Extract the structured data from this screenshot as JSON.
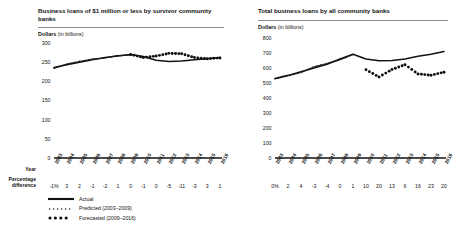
{
  "legend": {
    "items": [
      {
        "label": "Actual",
        "style": "solid-line",
        "color": "#111111"
      },
      {
        "label": "Predicted (2003–2009)",
        "style": "fine-dots",
        "color": "#1b1b1b"
      },
      {
        "label": "Forecasted (2009–2016)",
        "style": "bold-dots",
        "color": "#0d0d0d"
      }
    ]
  },
  "row_labels": {
    "year": "Year",
    "percentage_difference": "Percentage difference"
  },
  "axis_caption": {
    "strong": "Dollars",
    "light": "(in billions)"
  },
  "chart_data": [
    {
      "type": "line",
      "panel": "left",
      "title": "Business loans of $1 million or less by survivor community banks",
      "xlabel": "Year",
      "ylabel": "Dollars (in billions)",
      "ylim": [
        0,
        300
      ],
      "yticks": [
        300,
        250,
        200,
        150,
        100,
        50,
        0
      ],
      "ytick_labels": [
        "300",
        "250",
        "200",
        "150",
        "100",
        "50",
        "0"
      ],
      "grid": false,
      "legend_position": "below-left",
      "categories": [
        "2003",
        "2004",
        "2005",
        "2006",
        "2007",
        "2008",
        "2009",
        "2010",
        "2011",
        "2012",
        "2013",
        "2014",
        "2015",
        "2016"
      ],
      "series": [
        {
          "name": "Actual",
          "style": "solid-line",
          "values": [
            236,
            243,
            250,
            256,
            262,
            266,
            270,
            265,
            255,
            252,
            253,
            256,
            259,
            262
          ]
        },
        {
          "name": "Predicted (2003–2009)",
          "style": "fine-dots",
          "values": [
            234,
            245,
            252,
            258,
            261,
            267,
            269,
            null,
            null,
            null,
            null,
            null,
            null,
            null
          ]
        },
        {
          "name": "Forecasted (2009–2016)",
          "style": "bold-dots",
          "values": [
            null,
            null,
            null,
            null,
            null,
            null,
            270,
            262,
            266,
            273,
            272,
            262,
            259,
            261
          ]
        }
      ],
      "percentage_difference": [
        "-1%",
        "3",
        "2",
        "-1",
        "-2",
        "1",
        "0",
        "-1",
        "0",
        "-5",
        "-11",
        "-3",
        "3",
        "1"
      ]
    },
    {
      "type": "line",
      "panel": "right",
      "title": "Total business loans by all community banks",
      "xlabel": "Year",
      "ylabel": "Dollars (in billions)",
      "ylim": [
        0,
        800
      ],
      "yticks": [
        800,
        700,
        600,
        500,
        400,
        300,
        200,
        100,
        0
      ],
      "ytick_labels": [
        "800",
        "700",
        "600",
        "500",
        "400",
        "300",
        "200",
        "100",
        "0"
      ],
      "grid": false,
      "legend_position": "none",
      "categories": [
        "2003",
        "2004",
        "2005",
        "2006",
        "2007",
        "2008",
        "2009",
        "2010",
        "2011",
        "2012",
        "2013",
        "2014",
        "2015",
        "2016"
      ],
      "series": [
        {
          "name": "Actual",
          "style": "solid-line",
          "values": [
            530,
            551,
            575,
            600,
            625,
            660,
            692,
            660,
            648,
            650,
            660,
            678,
            692,
            710
          ]
        },
        {
          "name": "Predicted (2003–2009)",
          "style": "fine-dots",
          "values": [
            528,
            548,
            570,
            608,
            630,
            655,
            690,
            null,
            null,
            null,
            null,
            null,
            null,
            null
          ]
        },
        {
          "name": "Forecasted (2009–2016)",
          "style": "bold-dots",
          "values": [
            null,
            null,
            null,
            null,
            null,
            null,
            null,
            588,
            540,
            590,
            622,
            560,
            552,
            572
          ]
        }
      ],
      "percentage_difference": [
        "0%",
        "2",
        "4",
        "-3",
        "-4",
        "0",
        "1",
        "10",
        "20",
        "13",
        "6",
        "16",
        "23",
        "20"
      ]
    }
  ]
}
